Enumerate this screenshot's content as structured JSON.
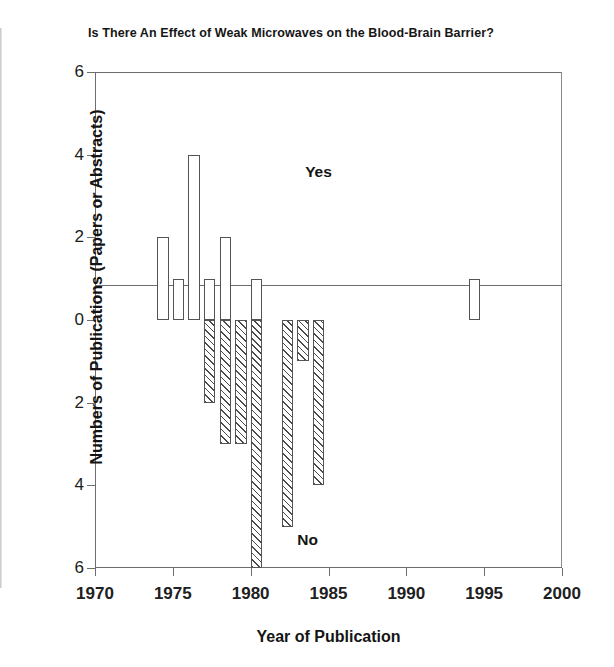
{
  "chart_data": {
    "type": "bar",
    "title": "Is There An Effect of Weak Microwaves on the Blood-Brain Barrier?",
    "xlabel": "Year of Publication",
    "ylabel": "Numbers of Publications (Papers or Abstracts)",
    "xlim": [
      1970,
      2000
    ],
    "ylim": [
      -6,
      6
    ],
    "grid": false,
    "legend_position": "inline-annotations",
    "xticks": [
      1970,
      1975,
      1980,
      1985,
      1990,
      1995,
      2000
    ],
    "xtick_labels": [
      "1970",
      "1975",
      "1980",
      "1985",
      "1990",
      "1995",
      "2000"
    ],
    "yticks": [
      6,
      4,
      2,
      0,
      -2,
      -4,
      -6
    ],
    "ytick_labels": [
      "6",
      "4",
      "2",
      "0",
      "2",
      "4",
      "6"
    ],
    "annotations": [
      {
        "text": "Yes",
        "x": 1983.5,
        "y": 3.8
      },
      {
        "text": "No",
        "x": 1983.0,
        "y": -5.1
      }
    ],
    "series": [
      {
        "name": "Yes",
        "fill": "white",
        "edge": "#545454",
        "x": [
          1974,
          1975,
          1976,
          1977,
          1978,
          1980,
          1994
        ],
        "values": [
          2,
          1,
          4,
          1,
          2,
          1,
          1
        ]
      },
      {
        "name": "No",
        "fill": "diagonal-hatch",
        "edge": "#545454",
        "x": [
          1977,
          1978,
          1979,
          1980,
          1982,
          1983,
          1984
        ],
        "values": [
          -2,
          -3,
          -3,
          -6,
          -5,
          -1,
          -4
        ]
      }
    ]
  }
}
